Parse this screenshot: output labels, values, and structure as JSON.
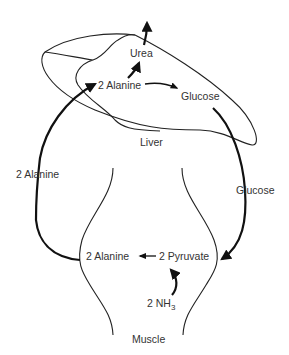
{
  "diagram": {
    "type": "glucose-alanine cycle",
    "organs": {
      "liver": "Liver",
      "muscle": "Muscle"
    },
    "liver_nodes": {
      "urea": "Urea",
      "alanine": "2 Alanine",
      "glucose": "Glucose"
    },
    "blood_labels": {
      "alanine": "2 Alanine",
      "glucose": "Glucose"
    },
    "muscle_nodes": {
      "alanine": "2 Alanine",
      "pyruvate": "2 Pyruvate",
      "ammonia_prefix": "2 NH",
      "ammonia_subscript": "3"
    },
    "edges": [
      {
        "from": "muscle.alanine",
        "to": "liver.alanine",
        "label": "2 Alanine"
      },
      {
        "from": "liver.alanine",
        "to": "liver.glucose"
      },
      {
        "from": "liver.alanine",
        "to": "liver.urea"
      },
      {
        "from": "liver.urea",
        "to": "excreted"
      },
      {
        "from": "liver.glucose",
        "to": "muscle.pyruvate",
        "label": "Glucose"
      },
      {
        "from": "muscle.pyruvate",
        "to": "muscle.alanine"
      },
      {
        "from": "muscle.ammonia",
        "to": "muscle.pyruvate"
      }
    ],
    "colors": {
      "line": "#111111",
      "text": "#333333",
      "background": "#ffffff"
    }
  }
}
